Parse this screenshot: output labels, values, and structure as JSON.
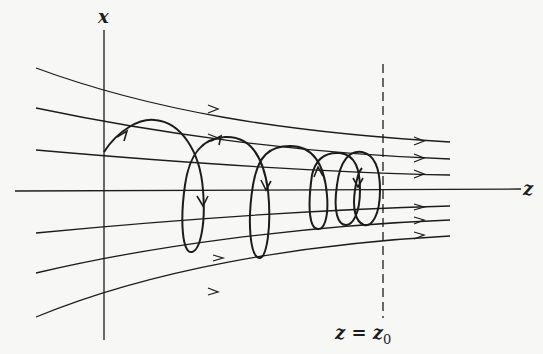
{
  "figure": {
    "axes": {
      "x_label": "x",
      "z_label": "z"
    },
    "marker": {
      "label_lhs": "z = z",
      "label_sub": "0",
      "style": "dashed vertical line"
    },
    "field_lines": {
      "count": 6,
      "description": "converging magnetic field lines with arrows pointing in +z direction"
    },
    "trajectory": {
      "description": "helical particle orbit with decreasing pitch approaching z = z0 (magnetic mirror)",
      "loops": 5
    },
    "colors": {
      "ink": "#1c1c1c",
      "background": "#f7f7f5"
    }
  }
}
